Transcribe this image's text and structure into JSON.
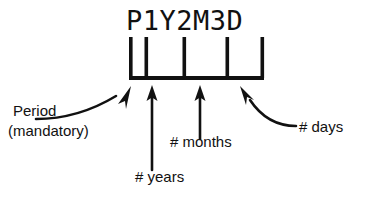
{
  "figure": {
    "duration_string": "P1Y2M3D",
    "ink_color": "#111111",
    "background_color": "#ffffff"
  },
  "labels": {
    "period_line1": "Period",
    "period_line2": "(mandatory)",
    "years": "# years",
    "months": "# months",
    "days": "# days"
  },
  "comb": {
    "tick_positions": [
      131,
      146,
      184,
      227,
      263
    ],
    "baseline_y": 79,
    "tick_top_y": 37
  },
  "annotations": [
    {
      "name": "period-arrow",
      "style": "curved",
      "target_tick": 0
    },
    {
      "name": "years-arrow",
      "style": "straight",
      "target_tick": 1
    },
    {
      "name": "months-arrow",
      "style": "straight",
      "target_tick": 2
    },
    {
      "name": "days-arrow",
      "style": "curved",
      "target_tick": 3
    }
  ]
}
